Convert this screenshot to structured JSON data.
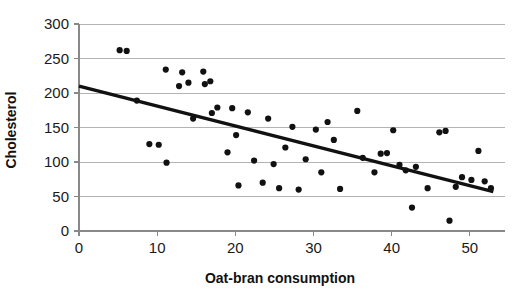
{
  "chart_data": {
    "type": "scatter",
    "title": "",
    "xlabel": "Oat-bran consumption",
    "ylabel": "Cholesterol",
    "xlim": [
      0,
      54.5
    ],
    "ylim": [
      0,
      300
    ],
    "xticks": [
      0,
      10,
      20,
      30,
      40,
      50
    ],
    "yticks": [
      0,
      50,
      100,
      150,
      200,
      250,
      300
    ],
    "grid": "horizontal",
    "legend": "none",
    "point_color": "#111111",
    "trendline_color": "#111111",
    "gridline_color": "#b3b3b3",
    "axis_color": "#888888",
    "trendline": {
      "type": "linear",
      "x_start": 0,
      "y_start": 210,
      "x_end": 53,
      "y_end": 57,
      "slope": -2.89,
      "intercept": 210
    },
    "points": [
      {
        "x": 5.2,
        "y": 262
      },
      {
        "x": 6.1,
        "y": 261
      },
      {
        "x": 7.4,
        "y": 189
      },
      {
        "x": 9.0,
        "y": 126
      },
      {
        "x": 10.2,
        "y": 125
      },
      {
        "x": 11.1,
        "y": 234
      },
      {
        "x": 11.2,
        "y": 99
      },
      {
        "x": 12.8,
        "y": 210
      },
      {
        "x": 13.2,
        "y": 230
      },
      {
        "x": 14.0,
        "y": 215
      },
      {
        "x": 14.6,
        "y": 163
      },
      {
        "x": 15.9,
        "y": 231
      },
      {
        "x": 16.1,
        "y": 213
      },
      {
        "x": 16.8,
        "y": 217
      },
      {
        "x": 17.0,
        "y": 171
      },
      {
        "x": 17.7,
        "y": 179
      },
      {
        "x": 19.0,
        "y": 114
      },
      {
        "x": 19.6,
        "y": 178
      },
      {
        "x": 20.1,
        "y": 139
      },
      {
        "x": 20.4,
        "y": 66
      },
      {
        "x": 21.6,
        "y": 172
      },
      {
        "x": 22.4,
        "y": 102
      },
      {
        "x": 23.5,
        "y": 70
      },
      {
        "x": 24.2,
        "y": 163
      },
      {
        "x": 24.9,
        "y": 97
      },
      {
        "x": 25.6,
        "y": 62
      },
      {
        "x": 26.4,
        "y": 121
      },
      {
        "x": 27.3,
        "y": 151
      },
      {
        "x": 28.1,
        "y": 60
      },
      {
        "x": 29.0,
        "y": 104
      },
      {
        "x": 30.3,
        "y": 147
      },
      {
        "x": 31.0,
        "y": 85
      },
      {
        "x": 31.8,
        "y": 158
      },
      {
        "x": 32.6,
        "y": 132
      },
      {
        "x": 33.4,
        "y": 61
      },
      {
        "x": 35.6,
        "y": 174
      },
      {
        "x": 36.3,
        "y": 106
      },
      {
        "x": 37.8,
        "y": 85
      },
      {
        "x": 38.6,
        "y": 112
      },
      {
        "x": 39.4,
        "y": 113
      },
      {
        "x": 40.2,
        "y": 146
      },
      {
        "x": 41.0,
        "y": 96
      },
      {
        "x": 41.8,
        "y": 88
      },
      {
        "x": 42.6,
        "y": 34
      },
      {
        "x": 43.1,
        "y": 93
      },
      {
        "x": 44.6,
        "y": 62
      },
      {
        "x": 46.1,
        "y": 143
      },
      {
        "x": 46.9,
        "y": 145
      },
      {
        "x": 47.4,
        "y": 15
      },
      {
        "x": 48.2,
        "y": 64
      },
      {
        "x": 49.0,
        "y": 78
      },
      {
        "x": 50.2,
        "y": 74
      },
      {
        "x": 51.1,
        "y": 116
      },
      {
        "x": 51.9,
        "y": 72
      },
      {
        "x": 52.7,
        "y": 62
      }
    ]
  }
}
